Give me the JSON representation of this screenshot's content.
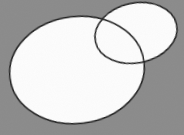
{
  "figure": {
    "width": 184,
    "height": 135,
    "background_color": "#8a8a8a",
    "fill_color": "#fdfdfd",
    "stroke_color": "#1c1c1c",
    "stroke_width": 1.5,
    "shapes": [
      {
        "name": "large-ellipse",
        "cx": 77,
        "cy": 70,
        "rx": 67.5,
        "ry": 53.5,
        "rotation": -7
      },
      {
        "name": "small-ellipse",
        "cx": 136,
        "cy": 33,
        "rx": 41.5,
        "ry": 30,
        "rotation": -12
      }
    ]
  }
}
